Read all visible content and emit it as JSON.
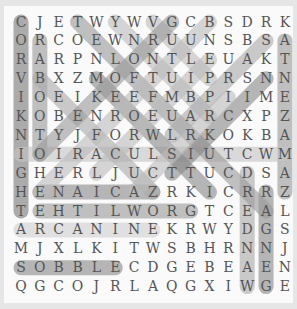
{
  "puzzle": {
    "rows": [
      "CJETWYWVGCBSDRK",
      "ORCOEWNRUUNSBSA",
      "RARPNLONTLEUAKT",
      "VBXZMOFTUIPRSNN",
      "IOEIKEEFMBPIIME",
      "KOBENROEUARCXPZ",
      "NTYJFORWLRKOKBA",
      "IOIRACULSIUTCWM",
      "GHERLJUCTTUCDSA",
      "HENAICAZRKICRRZ",
      "TEHTILWORGTCEAL",
      "ARCANINEKRWYDGS",
      "MJXLKITWSBHRNNJ",
      "SOBBLECDGEBEAEN",
      "QGCOJRLAQGXIWGE"
    ],
    "highlights": [
      {
        "r1": 0,
        "c1": 0,
        "r2": 10,
        "c2": 0,
        "color": "#777"
      },
      {
        "r1": 1,
        "c1": 1,
        "r2": 7,
        "c2": 1,
        "color": "#999"
      },
      {
        "r1": 1,
        "c1": 14,
        "r2": 9,
        "c2": 14,
        "color": "#999"
      },
      {
        "r1": 7,
        "c1": 0,
        "r2": 7,
        "c2": 14,
        "color": "#c4c4c4"
      },
      {
        "r1": 9,
        "c1": 1,
        "r2": 9,
        "c2": 7,
        "color": "#888"
      },
      {
        "r1": 10,
        "c1": 1,
        "r2": 10,
        "c2": 9,
        "color": "#999"
      },
      {
        "r1": 11,
        "c1": 0,
        "r2": 11,
        "c2": 7,
        "color": "#d0d0d0"
      },
      {
        "r1": 13,
        "c1": 0,
        "r2": 13,
        "c2": 5,
        "color": "#888"
      },
      {
        "r1": 8,
        "c1": 12,
        "r2": 14,
        "c2": 12,
        "color": "#aaa"
      },
      {
        "r1": 9,
        "c1": 13,
        "r2": 14,
        "c2": 13,
        "color": "#888"
      },
      {
        "r1": 0,
        "c1": 3,
        "r2": 10,
        "c2": 13,
        "color": "#999"
      },
      {
        "r1": 0,
        "c1": 5,
        "r2": 5,
        "c2": 10,
        "color": "#bbb"
      },
      {
        "r1": 0,
        "c1": 7,
        "r2": 3,
        "c2": 10,
        "color": "#bbb"
      },
      {
        "r1": 3,
        "c1": 4,
        "r2": 9,
        "c2": 10,
        "color": "#888"
      },
      {
        "r1": 3,
        "c1": 1,
        "r2": 9,
        "c2": 7,
        "color": "#aaa"
      },
      {
        "r1": 0,
        "c1": 8,
        "r2": 7,
        "c2": 1,
        "color": "#999"
      },
      {
        "r1": 0,
        "c1": 10,
        "r2": 9,
        "c2": 1,
        "color": "#bbb"
      },
      {
        "r1": 1,
        "c1": 13,
        "r2": 6,
        "c2": 8,
        "color": "#aaa"
      },
      {
        "r1": 2,
        "c1": 10,
        "r2": 8,
        "c2": 4,
        "color": "#bbb"
      },
      {
        "r1": 3,
        "c1": 13,
        "r2": 8,
        "c2": 8,
        "color": "#888"
      },
      {
        "r1": 4,
        "c1": 11,
        "r2": 9,
        "c2": 6,
        "color": "#bbb"
      }
    ]
  }
}
